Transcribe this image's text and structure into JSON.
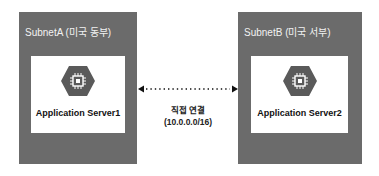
{
  "subnets": [
    {
      "label": "SubnetA (미국 동부)",
      "server": {
        "label": "Application Server1",
        "icon": "compute-engine-chip-icon"
      }
    },
    {
      "label": "SubnetB (미국 서부)",
      "server": {
        "label": "Application Server2",
        "icon": "compute-engine-chip-icon"
      }
    }
  ],
  "connection": {
    "label": "직접 연결",
    "cidr": "(10.0.0.0/16)",
    "style": "dotted-bidirectional-arrow"
  },
  "colors": {
    "subnet_bg": "#6b6b6b",
    "server_bg": "#ffffff",
    "hex_fill": "#5a5a5a",
    "text_dark": "#111111"
  }
}
